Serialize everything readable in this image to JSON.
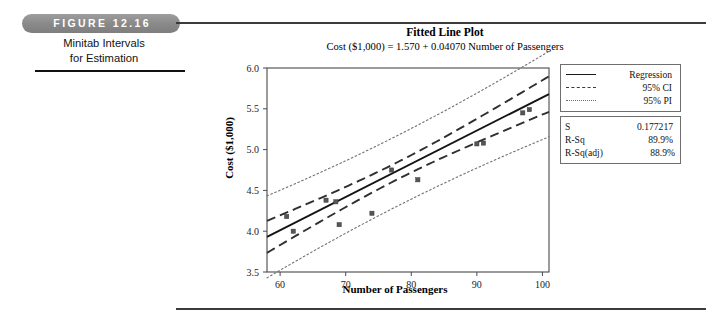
{
  "figure": {
    "pill_label": "FIGURE 12.16",
    "caption_line1": "Minitab Intervals",
    "caption_line2": "for Estimation"
  },
  "chart_data": {
    "type": "scatter",
    "title": "Fitted Line Plot",
    "subtitle": "Cost ($1,000) = 1.570 + 0.04070 Number of Passengers",
    "xlabel": "Number of Passengers",
    "ylabel": "Cost ($1,000)",
    "xlim": [
      58,
      101
    ],
    "ylim": [
      3.5,
      6.0
    ],
    "xticks": [
      60,
      70,
      80,
      90,
      100
    ],
    "yticks": [
      "3.5",
      "4.0",
      "4.5",
      "5.0",
      "5.5",
      "6.0"
    ],
    "grid": false,
    "legend_position": "right",
    "intercept": 1.57,
    "slope": 0.0407,
    "points": [
      {
        "x": 61,
        "y": 4.18
      },
      {
        "x": 62,
        "y": 4.0
      },
      {
        "x": 67,
        "y": 4.38
      },
      {
        "x": 68.5,
        "y": 4.36
      },
      {
        "x": 69,
        "y": 4.08
      },
      {
        "x": 74,
        "y": 4.22
      },
      {
        "x": 77,
        "y": 4.75
      },
      {
        "x": 81,
        "y": 4.63
      },
      {
        "x": 90,
        "y": 5.07
      },
      {
        "x": 91,
        "y": 5.08
      },
      {
        "x": 97,
        "y": 5.45
      },
      {
        "x": 98,
        "y": 5.49
      }
    ],
    "ci_halfwidth_center": 0.105,
    "pi_halfwidth_center": 0.4,
    "series": [
      {
        "name": "Regression",
        "style": "solid"
      },
      {
        "name": "95% CI",
        "style": "dashed"
      },
      {
        "name": "95% PI",
        "style": "dotted"
      }
    ]
  },
  "legend": {
    "items": [
      {
        "label": "Regression",
        "style": "solid"
      },
      {
        "label": "95% CI",
        "style": "dashed"
      },
      {
        "label": "95% PI",
        "style": "dotted"
      }
    ]
  },
  "stats": {
    "s_key": "S",
    "s_value": "0.177217",
    "rsq_key": "R-Sq",
    "rsq_value": "89.9%",
    "rsqadj_key": "R-Sq(adj)",
    "rsqadj_value": "88.9%"
  },
  "colors": {
    "regression": "#141414",
    "ci": "#2f2f2f",
    "pi": "#707070",
    "point": "#555555",
    "axis": "#4a4a4a",
    "pill": "#8a8a8a",
    "rule": "#3b3b3b"
  }
}
